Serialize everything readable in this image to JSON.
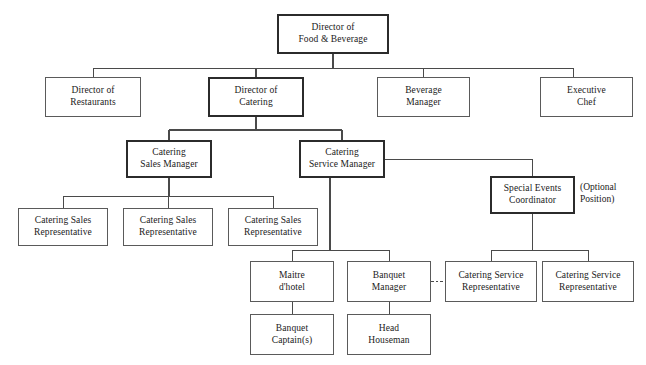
{
  "chart_data": {
    "type": "diagram",
    "diagram_type": "organizational-chart",
    "orientation": "top-down",
    "canvas": {
      "width": 646,
      "height": 365
    },
    "colors": {
      "background": "#ffffff",
      "box_fill": "#ffffff",
      "box_border": "#5a5a5a",
      "box_border_emphasis": "#2b2b2b",
      "connector": "#4a4a4a",
      "text": "#1a1a1a"
    },
    "levels": [
      {
        "level": 1,
        "nodes": [
          "director-food-beverage"
        ]
      },
      {
        "level": 2,
        "nodes": [
          "director-restaurants",
          "director-catering",
          "beverage-manager",
          "executive-chef"
        ]
      },
      {
        "level": 3,
        "nodes": [
          "catering-sales-manager",
          "catering-service-manager"
        ]
      },
      {
        "level": 4,
        "nodes": [
          "special-events-coordinator"
        ]
      },
      {
        "level": 5,
        "nodes": [
          "catering-sales-rep-1",
          "catering-sales-rep-2",
          "catering-sales-rep-3"
        ]
      },
      {
        "level": 6,
        "nodes": [
          "maitre-dhotel",
          "banquet-manager",
          "catering-service-rep-1",
          "catering-service-rep-2"
        ]
      },
      {
        "level": 7,
        "nodes": [
          "banquet-captains",
          "head-houseman"
        ]
      }
    ],
    "nodes": [
      {
        "id": "director-food-beverage",
        "label": "Director of\nFood & Beverage",
        "x": 277,
        "y": 14,
        "w": 112,
        "h": 40,
        "emphasis": true
      },
      {
        "id": "director-restaurants",
        "label": "Director of\nRestaurants",
        "x": 45,
        "y": 77,
        "w": 96,
        "h": 40,
        "emphasis": false
      },
      {
        "id": "director-catering",
        "label": "Director of\nCatering",
        "x": 208,
        "y": 77,
        "w": 96,
        "h": 40,
        "emphasis": true
      },
      {
        "id": "beverage-manager",
        "label": "Beverage\nManager",
        "x": 377,
        "y": 77,
        "w": 93,
        "h": 40,
        "emphasis": false
      },
      {
        "id": "executive-chef",
        "label": "Executive\nChef",
        "x": 540,
        "y": 77,
        "w": 93,
        "h": 40,
        "emphasis": false
      },
      {
        "id": "catering-sales-manager",
        "label": "Catering\nSales Manager",
        "x": 126,
        "y": 140,
        "w": 86,
        "h": 38,
        "emphasis": true
      },
      {
        "id": "catering-service-manager",
        "label": "Catering\nService Manager",
        "x": 299,
        "y": 140,
        "w": 86,
        "h": 38,
        "emphasis": true
      },
      {
        "id": "special-events-coordinator",
        "label": "Special Events\nCoordinator",
        "x": 490,
        "y": 176,
        "w": 85,
        "h": 38,
        "emphasis": true
      },
      {
        "id": "catering-sales-rep-1",
        "label": "Catering Sales\nRepresentative",
        "x": 18,
        "y": 208,
        "w": 90,
        "h": 38,
        "emphasis": false
      },
      {
        "id": "catering-sales-rep-2",
        "label": "Catering Sales\nRepresentative",
        "x": 123,
        "y": 208,
        "w": 90,
        "h": 38,
        "emphasis": false
      },
      {
        "id": "catering-sales-rep-3",
        "label": "Catering Sales\nRepresentative",
        "x": 228,
        "y": 208,
        "w": 90,
        "h": 38,
        "emphasis": false
      },
      {
        "id": "maitre-dhotel",
        "label": "Maitre\nd'hotel",
        "x": 250,
        "y": 261,
        "w": 84,
        "h": 41,
        "emphasis": false
      },
      {
        "id": "banquet-manager",
        "label": "Banquet\nManager",
        "x": 347,
        "y": 261,
        "w": 84,
        "h": 41,
        "emphasis": false
      },
      {
        "id": "catering-service-rep-1",
        "label": "Catering Service\nRepresentative",
        "x": 445,
        "y": 261,
        "w": 92,
        "h": 41,
        "emphasis": false
      },
      {
        "id": "catering-service-rep-2",
        "label": "Catering Service\nRepresentative",
        "x": 542,
        "y": 261,
        "w": 92,
        "h": 41,
        "emphasis": false
      },
      {
        "id": "banquet-captains",
        "label": "Banquet\nCaptain(s)",
        "x": 250,
        "y": 314,
        "w": 84,
        "h": 41,
        "emphasis": false
      },
      {
        "id": "head-houseman",
        "label": "Head\nHouseman",
        "x": 347,
        "y": 314,
        "w": 84,
        "h": 41,
        "emphasis": false
      }
    ],
    "annotations": [
      {
        "id": "optional-position-note",
        "text": "(Optional\nPosition)",
        "x": 580,
        "y": 182
      }
    ],
    "edges": [
      {
        "from": "director-food-beverage",
        "to": "director-restaurants",
        "style": "solid"
      },
      {
        "from": "director-food-beverage",
        "to": "director-catering",
        "style": "solid"
      },
      {
        "from": "director-food-beverage",
        "to": "beverage-manager",
        "style": "solid"
      },
      {
        "from": "director-food-beverage",
        "to": "executive-chef",
        "style": "solid"
      },
      {
        "from": "director-catering",
        "to": "catering-sales-manager",
        "style": "solid"
      },
      {
        "from": "director-catering",
        "to": "catering-service-manager",
        "style": "solid"
      },
      {
        "from": "catering-sales-manager",
        "to": "catering-sales-rep-1",
        "style": "solid"
      },
      {
        "from": "catering-sales-manager",
        "to": "catering-sales-rep-2",
        "style": "solid"
      },
      {
        "from": "catering-sales-manager",
        "to": "catering-sales-rep-3",
        "style": "solid"
      },
      {
        "from": "catering-service-manager",
        "to": "special-events-coordinator",
        "style": "solid"
      },
      {
        "from": "catering-service-manager",
        "to": "maitre-dhotel",
        "style": "solid"
      },
      {
        "from": "catering-service-manager",
        "to": "banquet-manager",
        "style": "solid"
      },
      {
        "from": "special-events-coordinator",
        "to": "catering-service-rep-1",
        "style": "solid"
      },
      {
        "from": "special-events-coordinator",
        "to": "catering-service-rep-2",
        "style": "solid"
      },
      {
        "from": "maitre-dhotel",
        "to": "banquet-captains",
        "style": "solid"
      },
      {
        "from": "banquet-manager",
        "to": "head-houseman",
        "style": "solid"
      },
      {
        "from": "banquet-manager",
        "to": "catering-service-rep-1",
        "style": "dashed"
      }
    ],
    "connector_paths": [
      {
        "id": "root-stem",
        "d": "M 333 54 L 333 68",
        "style": "solid",
        "weight": 1.6
      },
      {
        "id": "level2-bus",
        "d": "M 93 68 L 573 68",
        "style": "solid",
        "weight": 1
      },
      {
        "id": "drop-director-restaurants",
        "d": "M 93 68 L 93 77",
        "style": "solid",
        "weight": 1
      },
      {
        "id": "drop-director-catering",
        "d": "M 256 68 L 256 77",
        "style": "solid",
        "weight": 1.6
      },
      {
        "id": "drop-beverage-manager",
        "d": "M 423 68 L 423 77",
        "style": "solid",
        "weight": 1
      },
      {
        "id": "drop-executive-chef",
        "d": "M 573 68 L 573 77",
        "style": "solid",
        "weight": 1
      },
      {
        "id": "catering-stem",
        "d": "M 256 117 L 256 130",
        "style": "solid",
        "weight": 1.6
      },
      {
        "id": "level3-bus",
        "d": "M 169 130 L 342 130",
        "style": "solid",
        "weight": 1.4
      },
      {
        "id": "drop-catering-sales-manager",
        "d": "M 169 130 L 169 140",
        "style": "solid",
        "weight": 1.4
      },
      {
        "id": "drop-catering-service-manager",
        "d": "M 342 130 L 342 140",
        "style": "solid",
        "weight": 1.4
      },
      {
        "id": "sales-manager-stem",
        "d": "M 169 178 L 169 196",
        "style": "solid",
        "weight": 1.4
      },
      {
        "id": "sales-rep-bus",
        "d": "M 63 196 L 273 196",
        "style": "solid",
        "weight": 1
      },
      {
        "id": "drop-sales-rep-1",
        "d": "M 63 196 L 63 208",
        "style": "solid",
        "weight": 1
      },
      {
        "id": "drop-sales-rep-2",
        "d": "M 168 196 L 168 208",
        "style": "solid",
        "weight": 1
      },
      {
        "id": "drop-sales-rep-3",
        "d": "M 273 196 L 273 208",
        "style": "solid",
        "weight": 1
      },
      {
        "id": "service-manager-to-events",
        "d": "M 385 159 L 532 159 L 532 176",
        "style": "solid",
        "weight": 1
      },
      {
        "id": "service-manager-stem",
        "d": "M 330 178 L 330 250",
        "style": "solid",
        "weight": 1.4
      },
      {
        "id": "service-child-bus",
        "d": "M 292 250 L 389 250",
        "style": "solid",
        "weight": 1
      },
      {
        "id": "drop-maitre-dhotel",
        "d": "M 292 250 L 292 261",
        "style": "solid",
        "weight": 1
      },
      {
        "id": "drop-banquet-manager",
        "d": "M 389 250 L 389 261",
        "style": "solid",
        "weight": 1
      },
      {
        "id": "events-stem",
        "d": "M 532 214 L 532 250",
        "style": "solid",
        "weight": 1
      },
      {
        "id": "service-rep-bus",
        "d": "M 491 250 L 588 250",
        "style": "solid",
        "weight": 1
      },
      {
        "id": "drop-service-rep-1",
        "d": "M 491 250 L 491 261",
        "style": "solid",
        "weight": 1
      },
      {
        "id": "drop-service-rep-2",
        "d": "M 588 250 L 588 261",
        "style": "solid",
        "weight": 1
      },
      {
        "id": "maitre-to-captains",
        "d": "M 292 302 L 292 314",
        "style": "solid",
        "weight": 1
      },
      {
        "id": "banquet-to-houseman",
        "d": "M 389 302 L 389 314",
        "style": "solid",
        "weight": 1
      },
      {
        "id": "banquet-to-service-rep-dashed",
        "d": "M 431 281 L 445 281",
        "style": "dashed",
        "weight": 1
      }
    ]
  }
}
